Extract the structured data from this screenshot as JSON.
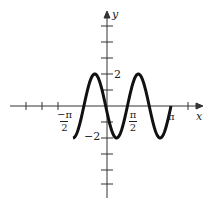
{
  "chart_data": {
    "type": "line",
    "title": "",
    "xlabel": "x",
    "ylabel": "y",
    "function": "y = -2 sin(3x)",
    "x_domain": [
      "-π/2",
      "π"
    ],
    "x_tick_labels": [
      "-π/2",
      "π/2",
      "π"
    ],
    "y_tick_labels": [
      "2",
      "-2"
    ],
    "ylim": [
      -2,
      2
    ],
    "grid": false,
    "legend": null,
    "series": [
      {
        "name": "curve",
        "x": [
          -1.571,
          -1.047,
          -0.524,
          0,
          0.524,
          1.047,
          1.571,
          2.094,
          2.618,
          3.142
        ],
        "values": [
          0,
          -2,
          2,
          0,
          -2,
          2,
          0,
          -2,
          2,
          0
        ]
      }
    ]
  },
  "labels": {
    "x_axis": "x",
    "y_axis": "y",
    "y_pos": "2",
    "y_neg": "−2",
    "neg_half_pi_num": "−π",
    "half_pi_num": "π",
    "denom": "2",
    "pi": "π"
  }
}
